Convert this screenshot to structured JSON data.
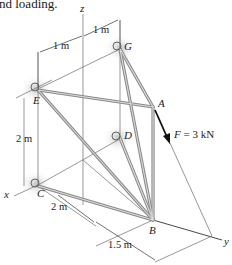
{
  "caption": "nd loading.",
  "axes": {
    "x": "x",
    "y": "y",
    "z": "z"
  },
  "points": {
    "A": "A",
    "B": "B",
    "C": "C",
    "D": "D",
    "E": "E",
    "G": "G"
  },
  "dimensions": {
    "top_left": "1 m",
    "top_right": "1 m",
    "vertical": "2 m",
    "bottom_x": "2 m",
    "bottom_y": "1.5 m"
  },
  "force": {
    "label_var": "F",
    "label_value": " = 3 kN",
    "color": "#111111"
  },
  "colors": {
    "member": "#8a8a8a",
    "member_highlight": "#d8d8d8",
    "construction_line": "#6b6b6b",
    "support_shadow": "#c8c8c8"
  }
}
